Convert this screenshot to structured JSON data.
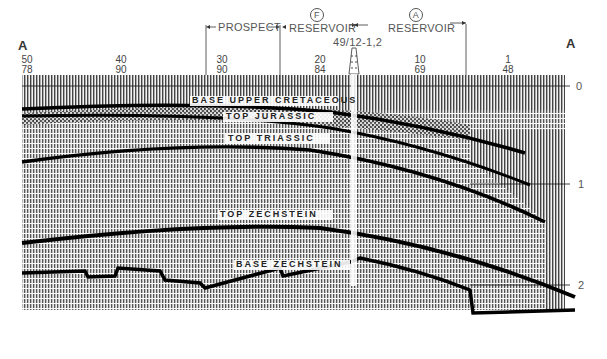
{
  "section": {
    "left_end": "A",
    "right_end": "A",
    "well": {
      "name": "49/12-1,2"
    },
    "zones": [
      {
        "label": "PROSPECT",
        "marker": ""
      },
      {
        "label": "RESERVOIR",
        "marker": "F"
      },
      {
        "label": "RESERVOIR",
        "marker": "A"
      }
    ],
    "shotpoints": [
      {
        "top": "50",
        "bottom": "78"
      },
      {
        "top": "40",
        "bottom": "90"
      },
      {
        "top": "30",
        "bottom": "90"
      },
      {
        "top": "20",
        "bottom": "84"
      },
      {
        "top": "10",
        "bottom": "69"
      },
      {
        "top": "1",
        "bottom": "48"
      }
    ],
    "time_axis": [
      "0",
      "1",
      "2"
    ],
    "horizons": [
      "BASE UPPER CRETACEOUS",
      "TOP JURASSIC",
      "TOP TRIASSIC",
      "TOP ZECHSTEIN",
      "BASE ZECHSTEIN"
    ]
  },
  "colors": {
    "ink": "#111111",
    "paper": "#ffffff",
    "trace": "#8a8a8a"
  }
}
